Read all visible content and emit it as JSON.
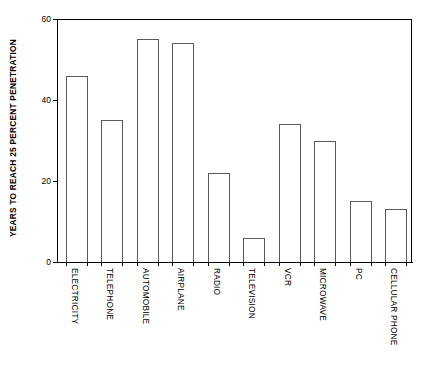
{
  "chart_data": {
    "type": "bar",
    "title": "",
    "subtitle": "",
    "xlabel": "",
    "ylabel": "YEARS TO REACH 25 PERCENT PENETRATION",
    "categories": [
      "ELECTRICITY",
      "TELEPHONE",
      "AUTOMOBILE",
      "AIRPLANE",
      "RADIO",
      "TELEVISION",
      "VCR",
      "MICROWAVE",
      "PC",
      "CELLULAR PHONE"
    ],
    "values": [
      46,
      35,
      55,
      54,
      22,
      6,
      34,
      30,
      15,
      13
    ],
    "ylim": [
      0,
      60
    ],
    "yticks": [
      0,
      20,
      40,
      60
    ],
    "ytick_labels": [
      "0",
      "20",
      "40",
      "60"
    ],
    "grid": false,
    "legend": false,
    "legend_position": "none",
    "bar_fill_color": "#ffffff",
    "bar_border_color": "#5a5a5a",
    "axis_color": "#000000",
    "background_color": "#ffffff"
  }
}
